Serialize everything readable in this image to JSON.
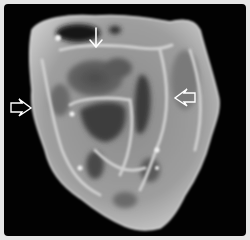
{
  "figure": {
    "background_color": "#020202",
    "border_color": "#e6e6e6",
    "specimen_color": "#9a9a9a",
    "arrows": [
      {
        "id": "left",
        "style": "open",
        "direction": "right",
        "x": 10,
        "y": 107,
        "color": "#ffffff"
      },
      {
        "id": "top",
        "style": "line",
        "direction": "down",
        "x": 96,
        "y": 28,
        "color": "#ffffff"
      },
      {
        "id": "right",
        "style": "open",
        "direction": "left",
        "x": 196,
        "y": 98,
        "color": "#ffffff"
      }
    ]
  }
}
